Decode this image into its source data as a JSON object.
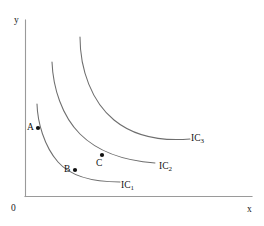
{
  "figure": {
    "background_color": "#ffffff",
    "axis_color": "#9a9a9a",
    "curve_color": "#6e6e6e",
    "point_color": "#111111"
  },
  "axes": {
    "y_label": "y",
    "x_label": "x",
    "origin_label": "0",
    "x_range_px": [
      25,
      252
    ],
    "y_range_px": [
      20,
      196
    ],
    "grid": false
  },
  "points": [
    {
      "id": "A",
      "label": "A",
      "on_curve": "IC1",
      "x_px": 38,
      "y_px": 128
    },
    {
      "id": "B",
      "label": "B",
      "on_curve": "IC1",
      "x_px": 75,
      "y_px": 170
    },
    {
      "id": "C",
      "label": "C",
      "on_curve": "IC2",
      "x_px": 102,
      "y_px": 155
    }
  ],
  "curves": [
    {
      "id": "IC1",
      "label": "IC",
      "subscript": "1",
      "path": "M 37 104 C 37.5 122 44 146 58 162 C 72 178 96 182 120 182",
      "label_pos_px": [
        121,
        181
      ]
    },
    {
      "id": "IC2",
      "label": "IC",
      "subscript": "2",
      "path": "M 52 62 C 53 88 62 116 80 134 C 99 153 128 161 155 163",
      "label_pos_px": [
        159,
        162
      ]
    },
    {
      "id": "IC3",
      "label": "IC",
      "subscript": "3",
      "path": "M 80 37 C 80 70 92 102 114 120 C 136 138 166 141 190 139",
      "label_pos_px": [
        191,
        134
      ]
    }
  ],
  "chart_data": {
    "type": "line",
    "xlabel": "x",
    "ylabel": "y",
    "grid": false,
    "legend_position": "inline-right-of-curve",
    "series": [
      {
        "name": "IC1",
        "description": "lowest indifference curve, passes through points A and B"
      },
      {
        "name": "IC2",
        "description": "middle indifference curve, passes through point C"
      },
      {
        "name": "IC3",
        "description": "highest indifference curve, no labelled points"
      }
    ],
    "annotations": [
      {
        "text": "A",
        "series": "IC1"
      },
      {
        "text": "B",
        "series": "IC1"
      },
      {
        "text": "C",
        "series": "IC2"
      },
      {
        "text": "IC1",
        "series": "IC1"
      },
      {
        "text": "IC2",
        "series": "IC2"
      },
      {
        "text": "IC3",
        "series": "IC3"
      },
      {
        "text": "0",
        "series": "origin"
      }
    ]
  }
}
